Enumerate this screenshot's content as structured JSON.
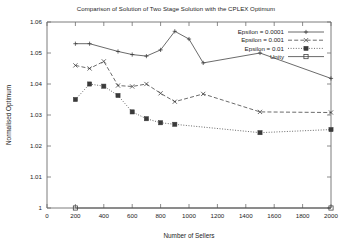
{
  "chart_data": {
    "type": "line",
    "title": "Comparison of Solution of Two Stage Solution with the CPLEX Optimum",
    "xlabel": "Number of  Sellers",
    "ylabel": "Normalised Optimum",
    "xlim": [
      0,
      2000
    ],
    "ylim": [
      1,
      1.06
    ],
    "xticks": [
      0,
      200,
      400,
      600,
      800,
      1000,
      1200,
      1400,
      1600,
      1800,
      2000
    ],
    "xtick_labels": [
      "0",
      "200",
      "400",
      "600",
      "800",
      "1000",
      "1200",
      "1400",
      "1600",
      "1800",
      "2000"
    ],
    "yticks": [
      1,
      1.01,
      1.02,
      1.03,
      1.04,
      1.05,
      1.06
    ],
    "ytick_labels": [
      "1",
      "1.01",
      "1.02",
      "1.03",
      "1.04",
      "1.05",
      "1.06"
    ],
    "grid": false,
    "legend_position": "top-right",
    "series": [
      {
        "name": "Epsilon = 0.0001",
        "marker": "plus",
        "dash": "solid",
        "x": [
          200,
          300,
          500,
          600,
          700,
          800,
          900,
          1000,
          1100,
          1500,
          2000
        ],
        "values": [
          1.053,
          1.053,
          1.0505,
          1.0495,
          1.049,
          1.051,
          1.057,
          1.0545,
          1.0468,
          1.05,
          1.0418
        ]
      },
      {
        "name": "Epsilon = 0.001",
        "marker": "cross",
        "dash": "dashed",
        "x": [
          200,
          300,
          400,
          500,
          600,
          700,
          800,
          900,
          1100,
          1500,
          2000
        ],
        "values": [
          1.046,
          1.045,
          1.0473,
          1.0395,
          1.0392,
          1.04,
          1.037,
          1.0343,
          1.0368,
          1.031,
          1.0308
        ]
      },
      {
        "name": "Epsilon = 0.01",
        "marker": "filled-square",
        "dash": "dotted",
        "x": [
          200,
          300,
          400,
          500,
          600,
          700,
          800,
          900,
          1500,
          2000
        ],
        "values": [
          1.035,
          1.04,
          1.0393,
          1.0363,
          1.031,
          1.0288,
          1.0275,
          1.027,
          1.0243,
          1.0253
        ]
      },
      {
        "name": "Unity",
        "marker": "open-square",
        "dash": "solid",
        "x": [
          200,
          2000
        ],
        "values": [
          1.0,
          1.0
        ]
      }
    ]
  },
  "legend": {
    "entries": [
      {
        "label": "Epsilon = 0.0001"
      },
      {
        "label": "Epsilon = 0.001"
      },
      {
        "label": "Epsilon = 0.01"
      },
      {
        "label": "Unity"
      }
    ]
  }
}
